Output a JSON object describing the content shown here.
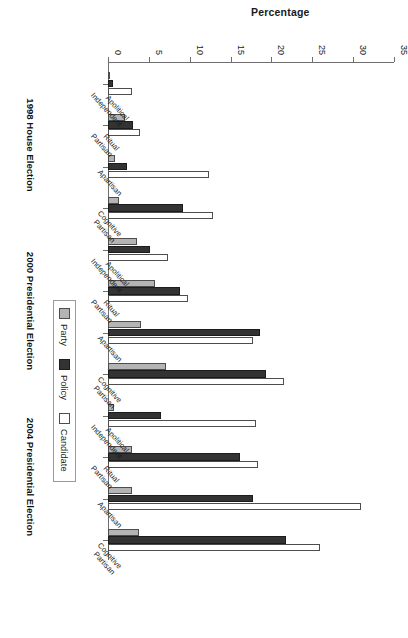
{
  "chart_data": {
    "type": "bar",
    "title": "",
    "xlabel": "",
    "ylabel": "Percentage",
    "ylim": [
      0,
      35
    ],
    "yticks": [
      0,
      5,
      10,
      15,
      20,
      25,
      30,
      35
    ],
    "grid": false,
    "legend_position": "right",
    "orientation": "vertical-bars-rotated-page",
    "categories": [
      "Apolitical Independent",
      "Ritual Partisan",
      "Apartisan",
      "Cognitive Partisan"
    ],
    "groups": [
      "1998 House Election",
      "2000 Presidential Election",
      "2004 Presidential Election"
    ],
    "series": [
      {
        "name": "Party",
        "color": "#b4b4b4",
        "values": {
          "1998 House Election": [
            0.3,
            2.1,
            0.9,
            1.4
          ],
          "2000 Presidential Election": [
            3.6,
            5.8,
            4.0,
            7.1
          ],
          "2004 Presidential Election": [
            0.7,
            2.9,
            2.9,
            3.8
          ]
        }
      },
      {
        "name": "Policy",
        "color": "#333333",
        "values": {
          "1998 House Election": [
            0.6,
            3.1,
            2.3,
            9.2
          ],
          "2000 Presidential Election": [
            5.1,
            8.8,
            18.6,
            19.3
          ],
          "2004 Presidential Election": [
            6.5,
            16.1,
            17.7,
            21.8
          ]
        }
      },
      {
        "name": "Candidate",
        "color": "#ffffff",
        "values": {
          "1998 House Election": [
            2.9,
            3.9,
            12.4,
            12.9
          ],
          "2000 Presidential Election": [
            7.3,
            9.8,
            17.8,
            21.5
          ],
          "2004 Presidential Election": [
            18.1,
            18.3,
            31.0,
            26.0
          ]
        }
      }
    ]
  },
  "legend": {
    "items": [
      {
        "label": "Party",
        "key": "party"
      },
      {
        "label": "Policy",
        "key": "policy"
      },
      {
        "label": "Candidate",
        "key": "candidate"
      }
    ]
  }
}
